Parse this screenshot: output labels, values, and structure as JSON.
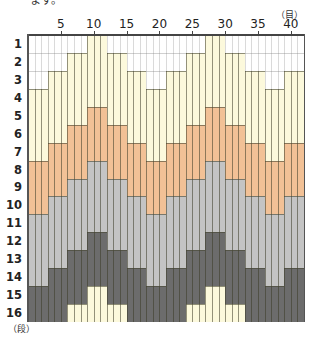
{
  "intro_text": "ます。",
  "axis": {
    "column_unit": "（目）",
    "row_unit": "（段）",
    "column_ticks": [
      "5",
      "10",
      "15",
      "20",
      "25",
      "30",
      "35",
      "40"
    ],
    "column_tick_positions": [
      5,
      10,
      15,
      20,
      25,
      30,
      35,
      40
    ],
    "row_labels": [
      "1",
      "2",
      "3",
      "4",
      "5",
      "6",
      "7",
      "8",
      "9",
      "10",
      "11",
      "12",
      "13",
      "14",
      "15",
      "16"
    ]
  },
  "chart": {
    "columns": 42,
    "rows": 16,
    "group_width": 3,
    "group_offsets": [
      3,
      2,
      1,
      0,
      1,
      2,
      3,
      2,
      1,
      0,
      1,
      2,
      3,
      2
    ],
    "band_sequence": [
      {
        "color_name": "yellow",
        "rows": 4
      },
      {
        "color_name": "orange",
        "rows": 3
      },
      {
        "color_name": "light-gray",
        "rows": 4
      },
      {
        "color_name": "dark-gray",
        "rows": 3
      }
    ],
    "colors": {
      "white": "#ffffff",
      "yellow": "#fcf9dc",
      "orange": "#f2c196",
      "light-gray": "#c4c4c4",
      "dark-gray": "#6c6c6c"
    }
  }
}
